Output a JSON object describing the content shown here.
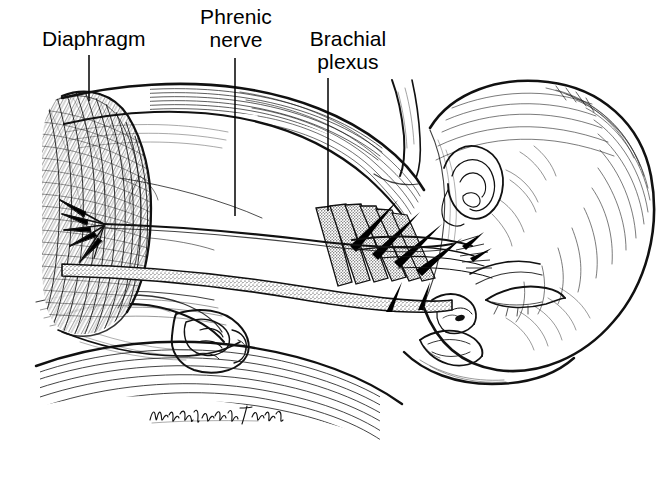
{
  "figure": {
    "kind": "medical-line-illustration",
    "background_color": "#ffffff",
    "ink_color": "#000000",
    "signature": "Phyllis Wood / Sweeney"
  },
  "labels": [
    {
      "name": "diaphragm",
      "text": "Diaphragm",
      "lines": [
        "Diaphragm"
      ],
      "leader": {
        "x1": 89,
        "y1": 55,
        "x2": 89,
        "y2": 101
      }
    },
    {
      "name": "phrenic-nerve",
      "text": "Phrenic nerve",
      "lines": [
        "Phrenic",
        "nerve"
      ],
      "leader": {
        "x1": 235,
        "y1": 58,
        "x2": 235,
        "y2": 216
      }
    },
    {
      "name": "brachial-plexus",
      "text": "Brachial plexus",
      "lines": [
        "Brachial",
        "plexus"
      ],
      "leader": {
        "x1": 328,
        "y1": 78,
        "x2": 328,
        "y2": 211
      }
    }
  ],
  "anatomy": [
    {
      "name": "diaphragm",
      "note": "dense cross-hatched muscular dome, left side of figure"
    },
    {
      "name": "phrenic-nerve",
      "note": "fine single nerve running horizontally, fanning into the diaphragm"
    },
    {
      "name": "brachial-plexus",
      "note": "stippled nerve roots radiating from the cervical spine toward the shoulder"
    },
    {
      "name": "infant-head",
      "note": "profile, eye closed, ear visible, lying on side"
    },
    {
      "name": "infant-arm",
      "note": "flexed arm and closed fist at lower left"
    },
    {
      "name": "neck-shoulder-band",
      "note": "muscle band sweeping from chest to head across the top"
    }
  ]
}
